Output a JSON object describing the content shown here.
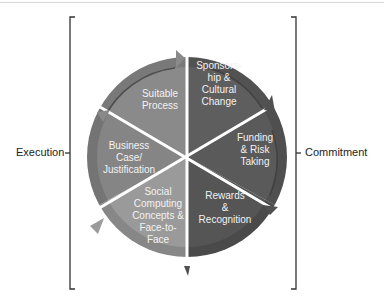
{
  "diagram": {
    "left_group": {
      "label": "Execution"
    },
    "right_group": {
      "label": "Commitment"
    },
    "segments": [
      {
        "label": "Suitable\nProcess",
        "color": "#8a8a8a"
      },
      {
        "label": "Sponsors-\nhip &\nCultural\nChange",
        "color": "#5e5e5e"
      },
      {
        "label": "Funding\n& Risk\nTaking",
        "color": "#5a5a5a"
      },
      {
        "label": "Rewards\n&\nRecognition",
        "color": "#555555"
      },
      {
        "label": "Social\nComputing\nConcepts &\nFace-to-\nFace",
        "color": "#9a9a9a"
      },
      {
        "label": "Business\nCase/\nJustification",
        "color": "#858585"
      }
    ]
  }
}
